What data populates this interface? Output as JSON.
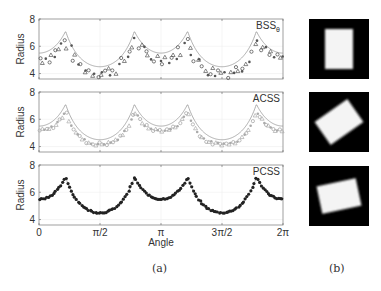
{
  "figure": {
    "caption_a": "(a)",
    "caption_b": "(b)",
    "xlabel": "Angle",
    "ylabel": "Radius",
    "xticks": [
      "0",
      "π/2",
      "π",
      "3π/2",
      "2π"
    ],
    "yticks": [
      "4",
      "6",
      "8"
    ]
  },
  "chart_data": [
    {
      "type": "scatter",
      "title": "BSS_θ",
      "xlabel": "Angle",
      "ylabel": "Radius",
      "xlim": [
        0,
        6.2832
      ],
      "ylim": [
        3.6,
        8
      ],
      "reference_curve": {
        "half_width": 5.5,
        "half_height": 4.5,
        "peak": 7.1,
        "min": 4.5
      },
      "marker_color": "#555555",
      "curve_color": "#999999",
      "noise": "high",
      "series": [
        {
          "name": "estimate",
          "offset": -0.6
        }
      ]
    },
    {
      "type": "scatter",
      "title": "ACSS",
      "xlabel": "Angle",
      "ylabel": "Radius",
      "xlim": [
        0,
        6.2832
      ],
      "ylim": [
        3.6,
        8
      ],
      "reference_curve": {
        "half_width": 5.5,
        "half_height": 4.5,
        "peak": 7.1,
        "min": 4.5
      },
      "marker_color": "#aaaaaa",
      "curve_color": "#999999",
      "noise": "low",
      "series": [
        {
          "name": "estimate",
          "offset": -0.5
        }
      ]
    },
    {
      "type": "scatter",
      "title": "PCSS",
      "xlabel": "Angle",
      "ylabel": "Radius",
      "xlim": [
        0,
        6.2832
      ],
      "ylim": [
        3.6,
        8
      ],
      "reference_curve": {
        "half_width": 5.5,
        "half_height": 4.5,
        "peak": 7.0,
        "min": 4.5
      },
      "marker_color": "#222222",
      "curve_color": "#999999",
      "noise": "very-low",
      "series": [
        {
          "name": "estimate",
          "offset": 0
        }
      ]
    }
  ],
  "images": [
    {
      "name": "rectangle-upright",
      "rotation": 0
    },
    {
      "name": "rectangle-rotated-ccw",
      "rotation": -35
    },
    {
      "name": "rectangle-rotated-slight",
      "rotation": 12
    }
  ]
}
